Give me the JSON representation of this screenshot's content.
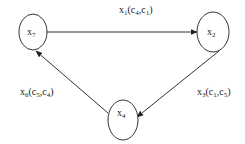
{
  "diagram": {
    "type": "directed-cycle-graph",
    "nodes": [
      {
        "id": "x7",
        "label": "x",
        "sub": "7"
      },
      {
        "id": "x2",
        "label": "x",
        "sub": "2"
      },
      {
        "id": "x4",
        "label": "x",
        "sub": "4"
      }
    ],
    "edges": [
      {
        "from": "x7",
        "to": "x2",
        "label": {
          "var": "x",
          "var_sub": "1",
          "a": "c",
          "a_sub": "4",
          "b": "c",
          "b_sub": "1"
        }
      },
      {
        "from": "x2",
        "to": "x4",
        "label": {
          "var": "x",
          "var_sub": "3",
          "a": "c",
          "a_sub": "1",
          "b": "c",
          "b_sub": "5"
        }
      },
      {
        "from": "x4",
        "to": "x7",
        "label": {
          "var": "x",
          "var_sub": "6",
          "a": "c",
          "a_sub": "5",
          "b": "c",
          "b_sub": "4"
        }
      }
    ],
    "colors": {
      "stroke": "#333333",
      "text": "#222222",
      "background": "#ffffff"
    }
  }
}
